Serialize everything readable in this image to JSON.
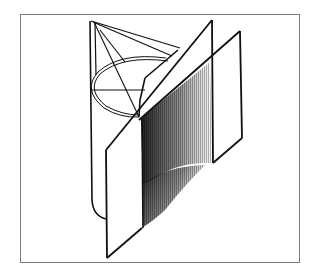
{
  "figure": {
    "frame": {
      "x": 20,
      "y": 14,
      "width": 280,
      "height": 249,
      "stroke": "#7a7a7a"
    },
    "colors": {
      "ink": "#111111",
      "frame": "#7a7a7a",
      "paper": "#ffffff"
    },
    "caption": ""
  }
}
